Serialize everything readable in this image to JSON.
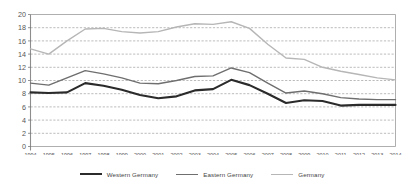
{
  "chart_data": {
    "type": "line",
    "title": "",
    "subtitle": "",
    "xlabel": "",
    "ylabel": "",
    "ylim": [
      0,
      20
    ],
    "yticks": [
      0,
      2,
      4,
      6,
      8,
      10,
      12,
      14,
      16,
      18,
      20
    ],
    "grid": "horizontal-dashed",
    "legend_position": "bottom",
    "categories": [
      "1994",
      "1995",
      "1996",
      "1997",
      "1998",
      "1999",
      "2000",
      "2001",
      "2002",
      "2003",
      "2004",
      "2005",
      "2006",
      "2007",
      "2008",
      "2009",
      "2010",
      "2011",
      "2012",
      "2013",
      "2014"
    ],
    "series": [
      {
        "name": "Western Germany",
        "color": "#2b2b2b",
        "width": 2.1,
        "values": [
          8.2,
          8.1,
          8.2,
          9.6,
          9.2,
          8.6,
          7.8,
          7.3,
          7.6,
          8.5,
          8.7,
          10.1,
          9.3,
          8.0,
          6.6,
          7.0,
          6.9,
          6.2,
          6.3,
          6.3,
          6.3
        ]
      },
      {
        "name": "Eastern Germany",
        "color": "#6f6f6f",
        "width": 1.4,
        "values": [
          9.6,
          9.3,
          10.4,
          11.5,
          11.0,
          10.4,
          9.6,
          9.5,
          10.0,
          10.6,
          10.7,
          11.9,
          11.2,
          9.6,
          8.1,
          8.4,
          8.0,
          7.4,
          7.2,
          7.1,
          7.1
        ]
      },
      {
        "name": "Germany",
        "color": "#b6b6b6",
        "width": 1.4,
        "values": [
          14.8,
          14.0,
          16.0,
          17.8,
          17.9,
          17.4,
          17.2,
          17.4,
          18.1,
          18.6,
          18.5,
          18.9,
          17.9,
          15.5,
          13.4,
          13.2,
          12.0,
          11.4,
          10.9,
          10.4,
          10.1
        ]
      }
    ]
  },
  "legend": {
    "items": [
      {
        "label": "Western Germany",
        "color": "#2b2b2b",
        "thickness": "2.2px"
      },
      {
        "label": "Eastern Germany",
        "color": "#6f6f6f",
        "thickness": "1.5px"
      },
      {
        "label": "Germany",
        "color": "#b6b6b6",
        "thickness": "1.5px"
      }
    ]
  },
  "axes": {
    "y_min_label": "0",
    "y_max_label": "20"
  }
}
